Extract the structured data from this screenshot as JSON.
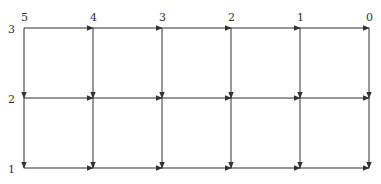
{
  "diagram": {
    "type": "directed-grid",
    "columns": [
      {
        "label": "5",
        "x": 24
      },
      {
        "label": "4",
        "x": 93
      },
      {
        "label": "3",
        "x": 162
      },
      {
        "label": "2",
        "x": 231
      },
      {
        "label": "1",
        "x": 300
      },
      {
        "label": "0",
        "x": 369
      }
    ],
    "rows": [
      {
        "label": "3",
        "y": 28
      },
      {
        "label": "2",
        "y": 98
      },
      {
        "label": "1",
        "y": 168
      }
    ],
    "edge_color": "#333333",
    "edges_description": "Horizontal edges point right (from column label 5 toward 0); vertical edges point down (from row 3 toward row 1)."
  }
}
